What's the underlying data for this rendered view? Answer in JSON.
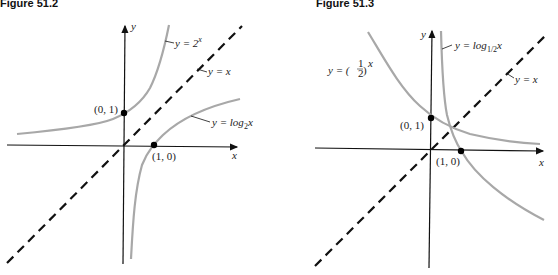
{
  "figures": [
    {
      "title": "Figure 51.2",
      "axis_labels": {
        "x": "x",
        "y": "y"
      },
      "curves": [
        {
          "name": "exp2",
          "label_lhs": "y = 2",
          "label_sup": "x"
        },
        {
          "name": "identity",
          "label": "y = x"
        },
        {
          "name": "log2",
          "label_lhs": "y = log",
          "label_sub": "2",
          "label_rhs": "x"
        }
      ],
      "points": [
        {
          "label": "(0, 1)"
        },
        {
          "label": "(1, 0)"
        }
      ]
    },
    {
      "title": "Figure 51.3",
      "axis_labels": {
        "x": "x",
        "y": "y"
      },
      "curves": [
        {
          "name": "half-exp",
          "label_lhs": "y = (",
          "label_num": "1",
          "label_den": "2",
          "label_rhs": ")",
          "label_sup": "x"
        },
        {
          "name": "log-half",
          "label_lhs": "y = log",
          "label_sub": "1/2",
          "label_rhs": "x"
        },
        {
          "name": "identity",
          "label": "y = x"
        }
      ],
      "points": [
        {
          "label": "(0, 1)"
        },
        {
          "label": "(1, 0)"
        }
      ]
    }
  ],
  "colors": {
    "axis": "#111111",
    "curve": "#a8a8a8",
    "dashed": "#111111",
    "point": "#000000"
  }
}
